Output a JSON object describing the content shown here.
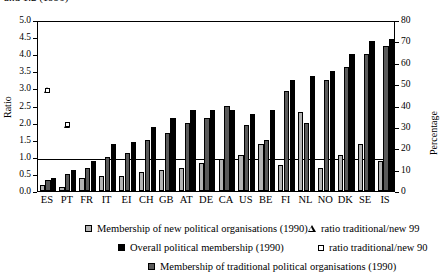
{
  "top_caption_fragment": "and 1.2 (1990)",
  "axes": {
    "left": {
      "title": "Ratio",
      "ticks": [
        "0.0",
        "0.5",
        "1.0",
        "1.5",
        "2.0",
        "2.5",
        "3.0",
        "3.5",
        "4.0",
        "4.5",
        "5.0"
      ],
      "min": 0,
      "max": 5
    },
    "right": {
      "title": "Percentage",
      "ticks": [
        "0",
        "10",
        "20",
        "30",
        "40",
        "50",
        "60",
        "70",
        "80"
      ],
      "min": 0,
      "max": 80
    }
  },
  "legend": [
    {
      "key": "new-political-swatch",
      "label": "Membership of new political organisations (1990)"
    },
    {
      "key": "ratio-trad-new-99-marker",
      "label": "ratio traditional/new 99"
    },
    {
      "key": "overall-political-swatch",
      "label": "Overall political membership (1990)"
    },
    {
      "key": "ratio-trad-new-90-marker",
      "label": "ratio traditional/new 90"
    },
    {
      "key": "traditional-political-swatch",
      "label": "Membership of traditional political organisations (1990)"
    }
  ],
  "chart_data": {
    "type": "bar",
    "title": "",
    "xlabel": "",
    "ylabel": "Ratio",
    "ylabel_secondary": "Percentage",
    "ylim": [
      0,
      5
    ],
    "ylim_secondary": [
      0,
      80
    ],
    "grid": false,
    "reference_line_ratio": 1.0,
    "legend_position": "bottom",
    "categories": [
      "ES",
      "PT",
      "FR",
      "IT",
      "EI",
      "CH",
      "GB",
      "AT",
      "DE",
      "CA",
      "US",
      "BE",
      "FI",
      "NL",
      "NO",
      "DK",
      "SE",
      "IS"
    ],
    "series": [
      {
        "name": "Membership of new political organisations (1990)",
        "axis": "right",
        "unit": "percentage",
        "type": "bar",
        "values": [
          3,
          2,
          6,
          7,
          7,
          9,
          10,
          11,
          13,
          15,
          17,
          22,
          12,
          37,
          11,
          17,
          22,
          14
        ]
      },
      {
        "name": "Membership of traditional political organisations (1990)",
        "axis": "right",
        "unit": "percentage",
        "type": "bar",
        "values": [
          5,
          8,
          11,
          16,
          18,
          24,
          27,
          32,
          34,
          40,
          31,
          24,
          47,
          32,
          52,
          58,
          64,
          68
        ]
      },
      {
        "name": "Overall political membership (1990)",
        "axis": "right",
        "unit": "percentage",
        "type": "bar",
        "values": [
          6,
          10,
          14,
          22,
          23,
          30,
          34,
          38,
          38,
          38,
          36,
          38,
          52,
          54,
          56,
          64,
          70,
          71
        ]
      },
      {
        "name": "ratio traditional/new 99",
        "axis": "left",
        "unit": "ratio",
        "type": "marker",
        "marker": "triangle-open",
        "values": [
          1.15,
          2.75,
          2.2,
          2.55,
          2.15,
          2.25,
          2.1,
          2.55,
          2.1,
          2.35,
          2.0,
          1.35,
          1.0,
          0.75,
          null,
          1.5,
          2.2,
          4.45
        ]
      },
      {
        "name": "ratio traditional/new 90",
        "axis": "left",
        "unit": "ratio",
        "type": "marker",
        "marker": "square-open",
        "values": [
          1.85,
          3.8,
          1.6,
          2.25,
          2.15,
          2.25,
          2.25,
          2.5,
          2.1,
          2.85,
          2.45,
          1.75,
          3.75,
          1.2,
          3.5,
          1.85,
          2.6,
          4.25
        ]
      }
    ]
  }
}
